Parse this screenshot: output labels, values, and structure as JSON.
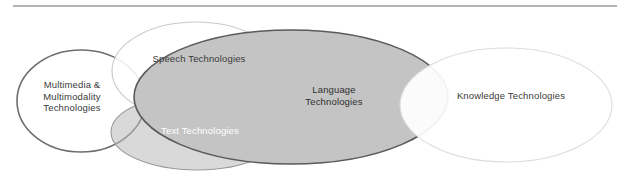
{
  "figure": {
    "title_rule": {
      "name": "top-horizontal-rule",
      "color": "#b4b4b4",
      "x1": 13,
      "x2": 617,
      "y": 6,
      "thickness": 2
    },
    "background_color": "#ffffff",
    "type": "venn-diagram",
    "ellipse_count": 5
  },
  "chart_data": {
    "type": "venn",
    "title": "",
    "background": "#ffffff",
    "sets": [
      {
        "id": "multimedia",
        "label_lines": [
          "Multimedia &",
          "Multimodality",
          "Technologies"
        ],
        "label_full": "Multimedia & Multimodality Technologies",
        "cx": 81,
        "cy": 101,
        "rx": 64,
        "ry": 51,
        "fill": "#ffffff",
        "fill_opacity": 0.0,
        "stroke": "#6e6e6e",
        "stroke_width": 1.6,
        "label_x": 72,
        "label_y": 88,
        "label_color": "#3a3a3a",
        "label_anchor": "middle"
      },
      {
        "id": "speech",
        "label_lines": [
          "Speech Technologies"
        ],
        "label_full": "Speech Technologies",
        "cx": 196,
        "cy": 71,
        "rx": 84,
        "ry": 49,
        "fill": "#ffffff",
        "fill_opacity": 0.88,
        "stroke": "#c9c9c9",
        "stroke_width": 1.1,
        "label_x": 199,
        "label_y": 62,
        "label_color": "#3a3a3a",
        "label_anchor": "middle"
      },
      {
        "id": "text",
        "label_lines": [
          "Text Technologies"
        ],
        "label_full": "Text Technologies",
        "cx": 197,
        "cy": 132,
        "rx": 86,
        "ry": 38,
        "fill": "#b9b9b9",
        "fill_opacity": 0.55,
        "stroke": "#9a9a9a",
        "stroke_width": 1.1,
        "label_x": 200,
        "label_y": 134,
        "label_color": "#ffffff",
        "label_anchor": "middle"
      },
      {
        "id": "language",
        "label_lines": [
          "Language",
          "Technologies"
        ],
        "label_full": "Language Technologies",
        "cx": 291,
        "cy": 97,
        "rx": 157,
        "ry": 67,
        "fill": "#c4c4c4",
        "fill_opacity": 1.0,
        "stroke": "#5a5a5a",
        "stroke_width": 1.6,
        "label_x": 334,
        "label_y": 93,
        "label_color": "#2f2f2f",
        "label_anchor": "middle"
      },
      {
        "id": "knowledge",
        "label_lines": [
          "Knowledge Technologies"
        ],
        "label_full": "Knowledge Technologies",
        "cx": 506,
        "cy": 105,
        "rx": 106,
        "ry": 57,
        "fill": "#ffffff",
        "fill_opacity": 0.92,
        "stroke": "#dcdcdc",
        "stroke_width": 1.1,
        "label_x": 511,
        "label_y": 99,
        "label_color": "#3a3a3a",
        "label_anchor": "middle"
      }
    ]
  }
}
